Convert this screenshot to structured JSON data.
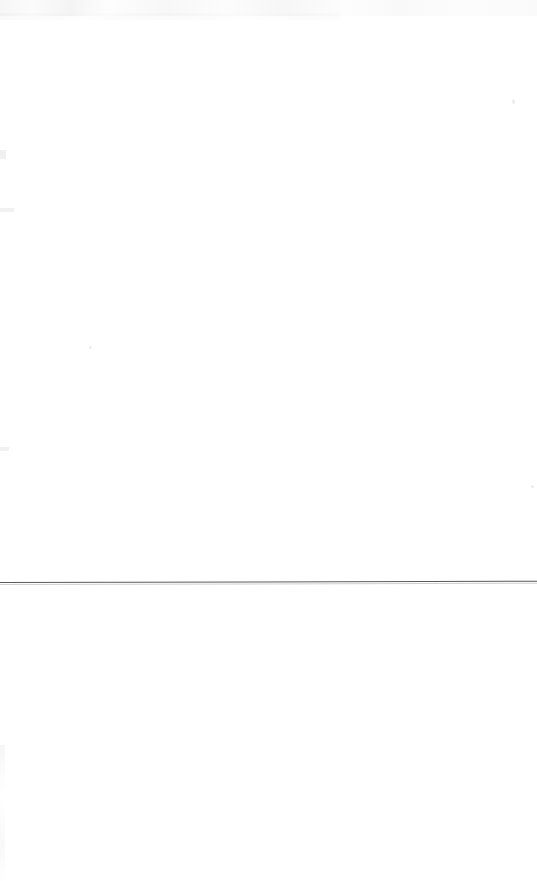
{
  "page": {
    "kind": "scanned-blank-page",
    "width": 537,
    "height": 881,
    "background_color": "#ffffff",
    "text_content": "",
    "notes_label": ""
  },
  "rule": {
    "name": "horizontal-rule",
    "color": "#5a5a5a",
    "y": 582,
    "x_start": 0,
    "x_end": 537,
    "thickness_px": 1.4,
    "label": ""
  },
  "artifacts": {
    "top_smudge_label": "",
    "left_edge_label": "",
    "speck_label": ""
  }
}
